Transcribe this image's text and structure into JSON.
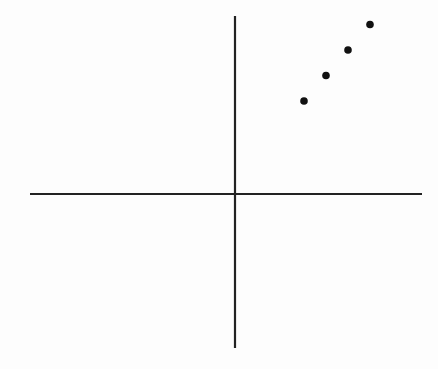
{
  "chart_data": {
    "type": "scatter",
    "title": "",
    "xlabel": "",
    "ylabel": "",
    "grid": false,
    "legend": null,
    "axes": {
      "style": "cartesian-cross",
      "ticks": false,
      "tick_labels": false
    },
    "points": [
      {
        "x": 1,
        "y": 1
      },
      {
        "x": 2,
        "y": 2
      },
      {
        "x": 3,
        "y": 3
      },
      {
        "x": 4,
        "y": 4
      }
    ],
    "note": "Four collinear points in the first quadrant; axes unlabeled, no scale shown"
  },
  "colors": {
    "background": "#fdfdfd",
    "axis": "#222222",
    "point": "#111111"
  }
}
